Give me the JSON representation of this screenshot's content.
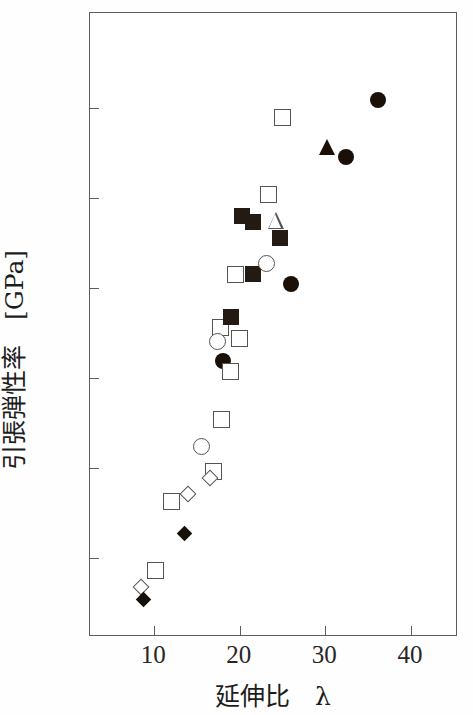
{
  "chart": {
    "type": "scatter",
    "title": "",
    "xlabel": "延伸比　λ",
    "ylabel": "引張弾性率　[GPa]",
    "xlim": [
      2.5,
      45.5
    ],
    "ylim": [
      1.2,
      70.5
    ],
    "xticks": [
      10,
      20,
      30,
      40
    ],
    "yticks": [
      10,
      20,
      30,
      40,
      50,
      60
    ],
    "xtick_labels": [
      "10",
      "20",
      "30",
      "40"
    ],
    "ytick_labels": [
      "10",
      "20",
      "30",
      "40",
      "50",
      "60"
    ],
    "grid": false,
    "legend": "none",
    "frame": "box"
  },
  "chart_data": {
    "type": "scatter",
    "title": "",
    "xlabel": "延伸比　λ",
    "ylabel": "引張弾性率　[GPa]",
    "xlim": [
      2.5,
      45.5
    ],
    "ylim": [
      1.2,
      70.5
    ],
    "xticks": [
      10,
      20,
      30,
      40
    ],
    "yticks": [
      10,
      20,
      30,
      40,
      50,
      60
    ],
    "grid": false,
    "legend": "none",
    "series": [
      {
        "name": "filled-circle",
        "marker": "circle-filled",
        "color": "#1a1008",
        "points": [
          {
            "x": 36.2,
            "y": 60.8
          },
          {
            "x": 32.4,
            "y": 54.5
          },
          {
            "x": 26.0,
            "y": 40.4
          },
          {
            "x": 18.0,
            "y": 31.8
          }
        ]
      },
      {
        "name": "open-square",
        "marker": "square-open",
        "color": "#55544f",
        "points": [
          {
            "x": 25.0,
            "y": 58.9
          },
          {
            "x": 23.3,
            "y": 50.3
          },
          {
            "x": 19.5,
            "y": 41.5
          },
          {
            "x": 17.8,
            "y": 35.6
          },
          {
            "x": 20.0,
            "y": 34.3
          },
          {
            "x": 18.9,
            "y": 30.7
          },
          {
            "x": 17.9,
            "y": 25.4
          },
          {
            "x": 16.9,
            "y": 19.6
          },
          {
            "x": 12.0,
            "y": 16.3
          },
          {
            "x": 10.1,
            "y": 8.6
          }
        ]
      },
      {
        "name": "filled-square",
        "marker": "square-filled",
        "color": "#231a14",
        "points": [
          {
            "x": 20.3,
            "y": 47.9
          },
          {
            "x": 21.5,
            "y": 47.3
          },
          {
            "x": 24.7,
            "y": 45.5
          },
          {
            "x": 21.6,
            "y": 41.5
          },
          {
            "x": 19.0,
            "y": 36.7
          }
        ]
      },
      {
        "name": "open-circle",
        "marker": "circle-open",
        "color": "#55544f",
        "points": [
          {
            "x": 23.1,
            "y": 42.7
          },
          {
            "x": 17.4,
            "y": 34.0
          },
          {
            "x": 15.5,
            "y": 22.4
          }
        ]
      },
      {
        "name": "filled-triangle",
        "marker": "triangle-filled",
        "color": "#1a1008",
        "points": [
          {
            "x": 30.2,
            "y": 55.4
          }
        ]
      },
      {
        "name": "open-triangle",
        "marker": "triangle-open",
        "color": "#55544f",
        "points": [
          {
            "x": 24.3,
            "y": 47.3
          }
        ]
      },
      {
        "name": "open-diamond",
        "marker": "diamond-open",
        "color": "#55544f",
        "points": [
          {
            "x": 16.5,
            "y": 18.9
          },
          {
            "x": 13.9,
            "y": 17.1
          },
          {
            "x": 8.5,
            "y": 6.8
          }
        ]
      },
      {
        "name": "filled-diamond",
        "marker": "diamond-filled",
        "color": "#16100a",
        "points": [
          {
            "x": 13.6,
            "y": 12.7
          },
          {
            "x": 8.8,
            "y": 5.4
          }
        ]
      }
    ]
  }
}
